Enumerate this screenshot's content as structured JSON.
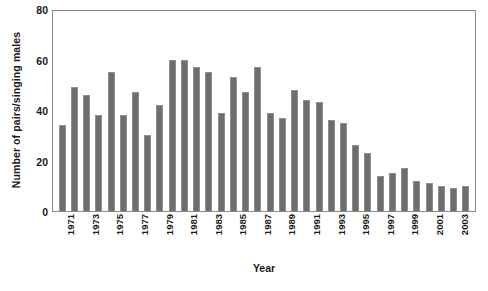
{
  "chart_data": {
    "type": "bar",
    "title": "",
    "xlabel": "Year",
    "ylabel": "Number of pairs/singing males",
    "ylim": [
      0,
      80
    ],
    "yticks": [
      0,
      20,
      40,
      60,
      80
    ],
    "ytick_labels": [
      "0",
      "20",
      "40",
      "60",
      "80"
    ],
    "grid": false,
    "legend": "none",
    "bar_color": "#6e6e6e",
    "bar_edge_color": "#8f8f8f",
    "frame_color": "#8a8a8a",
    "categories": [
      "1971",
      "1972",
      "1973",
      "1974",
      "1975",
      "1976",
      "1977",
      "1978",
      "1979",
      "1980",
      "1981",
      "1982",
      "1983",
      "1984",
      "1985",
      "1986",
      "1987",
      "1988",
      "1989",
      "1990",
      "1991",
      "1992",
      "1993",
      "1994",
      "1995",
      "1996",
      "1997",
      "1998",
      "1999",
      "2000",
      "2001",
      "2002",
      "2003",
      "2004"
    ],
    "xtick_labels": [
      "1971",
      "",
      "1973",
      "",
      "1975",
      "",
      "1977",
      "",
      "1979",
      "",
      "1981",
      "",
      "1983",
      "",
      "1985",
      "",
      "1987",
      "",
      "1989",
      "",
      "1991",
      "",
      "1993",
      "",
      "1995",
      "",
      "1997",
      "",
      "1999",
      "",
      "2001",
      "",
      "2003",
      ""
    ],
    "values": [
      34,
      49,
      46,
      38,
      55,
      38,
      47,
      30,
      42,
      60,
      60,
      57,
      55,
      39,
      53,
      47,
      57,
      39,
      37,
      48,
      44,
      43,
      36,
      35,
      26,
      23,
      14,
      15,
      17,
      12,
      11,
      10,
      9,
      10
    ],
    "series": [
      {
        "name": "Number of pairs/singing males",
        "values": [
          34,
          49,
          46,
          38,
          55,
          38,
          47,
          30,
          42,
          60,
          60,
          57,
          55,
          39,
          53,
          47,
          57,
          39,
          37,
          48,
          44,
          43,
          36,
          35,
          26,
          23,
          14,
          15,
          17,
          12,
          11,
          10,
          9,
          10
        ]
      }
    ]
  }
}
